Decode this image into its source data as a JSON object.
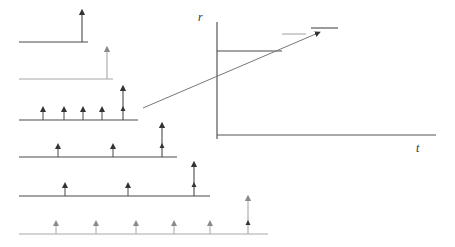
{
  "diagram": {
    "title": "",
    "colors": {
      "dark": "#4a4a4a",
      "light": "#a8a8a8",
      "axis": "#555555",
      "arrow": "#777777"
    },
    "axes": {
      "y_label": "r",
      "x_label": "t",
      "origin": [
        217,
        135
      ],
      "y_top": 22,
      "y_bottom": 139,
      "x_right": 436
    },
    "impulse_rows": [
      {
        "baseline_y": 42,
        "x_start": 19,
        "x_end": 88,
        "color": "dark",
        "impulses": [],
        "big": {
          "x": 82,
          "top": 12
        }
      },
      {
        "baseline_y": 79,
        "x_start": 19,
        "x_end": 113,
        "color": "light",
        "impulses": [],
        "big": {
          "x": 107,
          "top": 49
        }
      },
      {
        "baseline_y": 120,
        "x_start": 19,
        "x_end": 138,
        "color": "dark",
        "impulses": [
          43,
          64,
          83,
          102
        ],
        "big": {
          "x": 123,
          "top": 88
        }
      },
      {
        "baseline_y": 157,
        "x_start": 19,
        "x_end": 177,
        "color": "dark",
        "impulses": [
          58,
          113
        ],
        "big": {
          "x": 162,
          "top": 125
        }
      },
      {
        "baseline_y": 196,
        "x_start": 19,
        "x_end": 210,
        "color": "dark",
        "impulses": [
          65,
          128
        ],
        "big": {
          "x": 194,
          "top": 164
        }
      },
      {
        "baseline_y": 234,
        "x_start": 19,
        "x_end": 268,
        "color": "light",
        "impulses": [
          56,
          96,
          136,
          174,
          210
        ],
        "big": {
          "x": 248,
          "top": 198
        }
      }
    ],
    "small_impulse_height": 11,
    "trend_arrow": {
      "from": [
        143,
        108
      ],
      "to": [
        318,
        33
      ]
    },
    "step_segments": [
      {
        "y": 51,
        "x1": 217,
        "x2": 282,
        "color": "dark"
      },
      {
        "y": 34,
        "x1": 282,
        "x2": 306,
        "color": "light"
      },
      {
        "y": 28,
        "x1": 311,
        "x2": 338,
        "color": "dark"
      }
    ]
  }
}
